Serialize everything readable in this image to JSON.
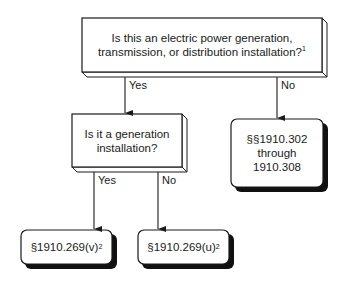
{
  "diagram": {
    "type": "flowchart",
    "nodes": {
      "q1": {
        "kind": "decision",
        "text": "Is this an electric power generation, transmission, or distribution installation?",
        "line1": "Is this an electric power generation,",
        "line2": "transmission, or distribution installation?",
        "footnote": "1"
      },
      "q2": {
        "kind": "decision",
        "line1": "Is it a generation",
        "line2": "installation?"
      },
      "r_no": {
        "kind": "result",
        "line1": "§§1910.302",
        "line2": "through",
        "line3": "1910.308"
      },
      "r_v": {
        "kind": "result",
        "text": "§1910.269(v)",
        "footnote": "2"
      },
      "r_u": {
        "kind": "result",
        "text": "§1910.269(u)",
        "footnote": "2"
      }
    },
    "edges": {
      "q1_yes": {
        "from": "q1",
        "to": "q2",
        "label": "Yes"
      },
      "q1_no": {
        "from": "q1",
        "to": "r_no",
        "label": "No"
      },
      "q2_yes": {
        "from": "q2",
        "to": "r_v",
        "label": "Yes"
      },
      "q2_no": {
        "from": "q2",
        "to": "r_u",
        "label": "No"
      }
    },
    "colors": {
      "stroke": "#1a1a1a",
      "fill": "#ffffff",
      "shadow": "#111111"
    }
  }
}
